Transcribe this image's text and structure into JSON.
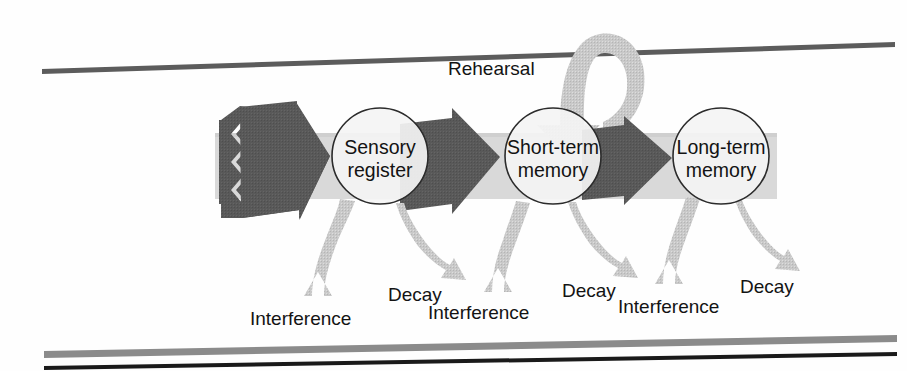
{
  "figure": {
    "background_color": "#fefefe",
    "rules": {
      "top_rule_color": "#5c5c5c",
      "bottom_rule_gray_color": "#8b8b8b",
      "bottom_rule_dark_color": "#1a1a1a"
    },
    "colors": {
      "dark_arrow": "#595959",
      "light_arrow": "#c9c9c9",
      "band": "#d4d4d4",
      "circle_fill": "#f2f2f2",
      "circle_stroke": "#2b2b2b",
      "text": "#131313"
    }
  },
  "nodes": [
    {
      "id": "sensory-register",
      "line1": "Sensory",
      "line2": "register",
      "cx": 380,
      "cy": 156,
      "r": 48
    },
    {
      "id": "short-term-memory",
      "line1": "Short-term",
      "line2": "memory",
      "cx": 553,
      "cy": 156,
      "r": 48
    },
    {
      "id": "long-term-memory",
      "line1": "Long-term",
      "line2": "memory",
      "cx": 721,
      "cy": 156,
      "r": 48
    }
  ],
  "flow_arrows": [
    {
      "id": "input-arrow",
      "from": "input",
      "to": "sensory-register"
    },
    {
      "id": "sensory-to-short",
      "from": "sensory-register",
      "to": "short-term-memory"
    },
    {
      "id": "short-to-long",
      "from": "short-term-memory",
      "to": "long-term-memory"
    }
  ],
  "loop": {
    "id": "rehearsal-loop",
    "label": "Rehearsal",
    "label_x": 448,
    "label_y": 75,
    "target": "short-term-memory"
  },
  "loss_pairs": [
    {
      "node": "sensory-register",
      "interference": {
        "label": "Interference",
        "label_x": 250,
        "label_y": 325
      },
      "decay": {
        "label": "Decay",
        "label_x": 388,
        "label_y": 301
      }
    },
    {
      "node": "short-term-memory",
      "interference": {
        "label": "Interference",
        "label_x": 428,
        "label_y": 319
      },
      "decay": {
        "label": "Decay",
        "label_x": 562,
        "label_y": 297
      }
    },
    {
      "node": "long-term-memory",
      "interference": {
        "label": "Interference",
        "label_x": 618,
        "label_y": 313
      },
      "decay": {
        "label": "Decay",
        "label_x": 740,
        "label_y": 293
      }
    }
  ]
}
